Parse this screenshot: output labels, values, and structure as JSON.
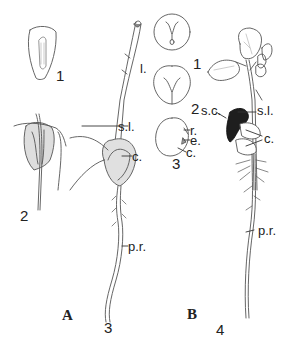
{
  "figure": {
    "panels": [
      {
        "id": "A",
        "label": "A",
        "stages": [
          "1",
          "2",
          "3"
        ],
        "parts": {
          "l": "l.",
          "sl": "s.l.",
          "c": "c.",
          "pr": "p.r."
        }
      },
      {
        "id": "B",
        "label": "B",
        "stages": [
          "1",
          "2",
          "3",
          "4"
        ],
        "parts": {
          "r": "r.",
          "e": "e.",
          "c3": "c.",
          "sc": "s.c.",
          "sl": "s.l.",
          "c": "c.",
          "pr": "p.r."
        }
      }
    ],
    "colors": {
      "line": "#555555",
      "stipple": "#cfcfcf",
      "seed_coat": "#1e1e1e",
      "background": "#ffffff"
    }
  }
}
